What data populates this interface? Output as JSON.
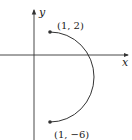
{
  "diagram": {
    "type": "parametric-curve-plot",
    "axes": {
      "x_label": "x",
      "y_label": "y"
    },
    "points": [
      {
        "label": "(1, 2)",
        "x": 1,
        "y": 2
      },
      {
        "label": "(1, −6)",
        "x": 1,
        "y": -6
      }
    ],
    "curve": {
      "shape": "semicircle",
      "center": [
        1,
        -2
      ],
      "radius": 4,
      "side": "right"
    },
    "colors": {
      "axis": "#333333",
      "curve": "#333333",
      "background": "#ffffff"
    }
  }
}
